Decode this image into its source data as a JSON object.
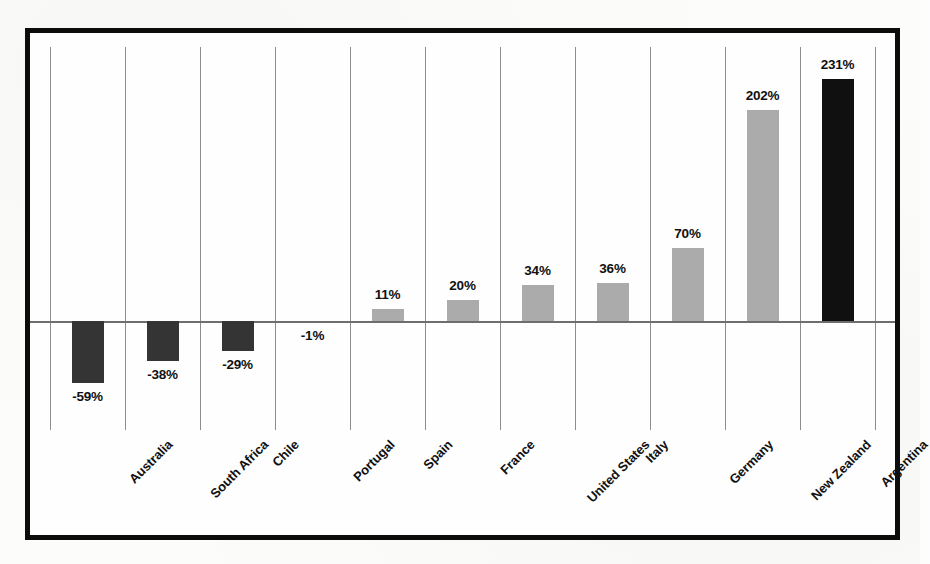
{
  "chart_data": {
    "type": "bar",
    "title": "",
    "subtitle": "",
    "xlabel": "",
    "ylabel": "",
    "grid": "vertical-only",
    "legend": "none",
    "value_suffix": "%",
    "baseline": 0,
    "ylim": [
      -59,
      231
    ],
    "categories": [
      "Australia",
      "South Africa",
      "Chile",
      "Portugal",
      "Spain",
      "France",
      "United States",
      "Italy",
      "Germany",
      "New Zealand",
      "Argentina"
    ],
    "values": [
      -59,
      -38,
      -29,
      -1,
      11,
      20,
      34,
      36,
      70,
      202,
      231
    ],
    "point_labels": [
      "-59%",
      "-38%",
      "-29%",
      "-1%",
      "11%",
      "20%",
      "34%",
      "36%",
      "70%",
      "202%",
      "231%"
    ],
    "bar_styles": [
      "negative",
      "negative",
      "negative",
      "negative",
      "positive",
      "positive",
      "positive",
      "positive",
      "positive",
      "positive",
      "highlight"
    ]
  },
  "colors": {
    "negative_bar": "#343434",
    "positive_bar": "#ababab",
    "highlight_bar": "#101010",
    "frame": "#0c0c0c",
    "gridline": "#8d8d8d",
    "axis": "#6e6e6e",
    "text": "#101010",
    "background": "#fefefe"
  }
}
